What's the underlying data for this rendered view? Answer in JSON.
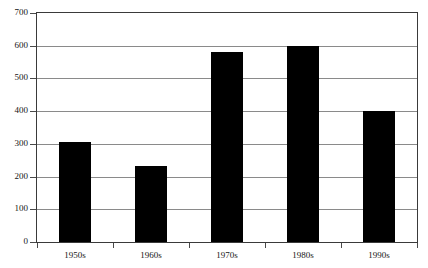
{
  "chart_data": {
    "type": "bar",
    "title": "",
    "subtitle": "",
    "xlabel": "",
    "ylabel": "",
    "categories": [
      "1950s",
      "1960s",
      "1970s",
      "1980s",
      "1990s"
    ],
    "values": [
      305,
      233,
      580,
      600,
      400
    ],
    "series": [
      {
        "name": "",
        "values": [
          305,
          233,
          580,
          600,
          400
        ]
      }
    ],
    "ylim": [
      0,
      700
    ],
    "yticks": [
      0,
      100,
      200,
      300,
      400,
      500,
      600,
      700
    ],
    "ytick_labels": [
      "0",
      "100",
      "200",
      "300",
      "400",
      "500",
      "600",
      "700"
    ],
    "grid": "horizontal",
    "legend": "none",
    "bar_color": "#000000",
    "grid_color": "#8a8a8a",
    "frame_color": "#3a3a3a",
    "background": "#ffffff",
    "annotations": []
  }
}
